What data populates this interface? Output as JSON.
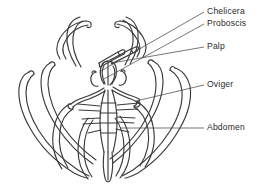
{
  "figure": {
    "kind": "anatomical-line-drawing",
    "ink_color": "#3a3a3a",
    "label_color": "#2b2b2b",
    "background_color": "#ffffff",
    "width": 263,
    "height": 192
  },
  "labels": [
    {
      "id": "chelicera",
      "text": "Chelicera"
    },
    {
      "id": "proboscis",
      "text": "Proboscis"
    },
    {
      "id": "palp",
      "text": "Palp"
    },
    {
      "id": "oviger",
      "text": "Oviger"
    },
    {
      "id": "abdomen",
      "text": "Abdomen"
    }
  ]
}
